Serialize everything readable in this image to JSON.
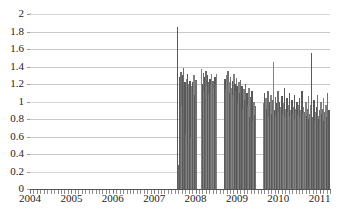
{
  "chart_data": {
    "type": "bar",
    "title": "",
    "subtitle": "",
    "xlabel": "",
    "ylabel": "",
    "xlim": [
      2004.0,
      2011.25
    ],
    "ylim": [
      0,
      2
    ],
    "grid": true,
    "legend": false,
    "legend_position": "none",
    "bar_color": "#6a6a6a",
    "gridline_color": "#c8c8c8",
    "axis_color": "#555555",
    "y_ticks": [
      "0",
      "0.2",
      "0.4",
      "0.6",
      "0.8",
      "1",
      "1.2",
      "1.4",
      "1.6",
      "1.8",
      "2"
    ],
    "y_tick_values": [
      0,
      0.2,
      0.4,
      0.6,
      0.8,
      1.0,
      1.2,
      1.4,
      1.6,
      1.8,
      2.0
    ],
    "x_ticks": [
      "2004",
      "2005",
      "2006",
      "2007",
      "2008",
      "2009",
      "2010",
      "2011"
    ],
    "x_tick_values": [
      2004,
      2005,
      2006,
      2007,
      2008,
      2009,
      2010,
      2011
    ],
    "x": [
      2007.55,
      2007.57,
      2007.59,
      2007.61,
      2007.63,
      2007.65,
      2007.67,
      2007.69,
      2007.71,
      2007.73,
      2007.75,
      2007.77,
      2007.79,
      2007.81,
      2007.83,
      2007.85,
      2007.87,
      2007.89,
      2007.91,
      2007.93,
      2007.95,
      2007.97,
      2007.99,
      2008.13,
      2008.15,
      2008.17,
      2008.19,
      2008.21,
      2008.23,
      2008.25,
      2008.27,
      2008.29,
      2008.31,
      2008.33,
      2008.35,
      2008.37,
      2008.39,
      2008.41,
      2008.43,
      2008.45,
      2008.47,
      2008.49,
      2008.69,
      2008.71,
      2008.73,
      2008.75,
      2008.77,
      2008.79,
      2008.81,
      2008.83,
      2008.85,
      2008.87,
      2008.89,
      2008.91,
      2008.93,
      2008.95,
      2008.97,
      2008.99,
      2009.01,
      2009.03,
      2009.05,
      2009.07,
      2009.09,
      2009.11,
      2009.13,
      2009.15,
      2009.17,
      2009.19,
      2009.21,
      2009.23,
      2009.25,
      2009.27,
      2009.29,
      2009.31,
      2009.33,
      2009.35,
      2009.37,
      2009.39,
      2009.41,
      2009.43,
      2009.63,
      2009.65,
      2009.67,
      2009.69,
      2009.71,
      2009.73,
      2009.75,
      2009.77,
      2009.79,
      2009.81,
      2009.83,
      2009.85,
      2009.87,
      2009.89,
      2009.91,
      2009.93,
      2009.95,
      2009.97,
      2009.99,
      2010.01,
      2010.03,
      2010.05,
      2010.07,
      2010.09,
      2010.11,
      2010.13,
      2010.15,
      2010.17,
      2010.19,
      2010.21,
      2010.23,
      2010.25,
      2010.27,
      2010.29,
      2010.31,
      2010.33,
      2010.35,
      2010.37,
      2010.39,
      2010.41,
      2010.43,
      2010.45,
      2010.47,
      2010.49,
      2010.51,
      2010.53,
      2010.55,
      2010.57,
      2010.59,
      2010.61,
      2010.63,
      2010.65,
      2010.67,
      2010.69,
      2010.71,
      2010.73,
      2010.75,
      2010.77,
      2010.79,
      2010.81,
      2010.83,
      2010.85,
      2010.87,
      2010.89,
      2010.91,
      2010.93,
      2010.95,
      2010.97,
      2010.99,
      2011.01,
      2011.03,
      2011.05,
      2011.07,
      2011.09,
      2011.11,
      2011.13,
      2011.15,
      2011.17,
      2011.19,
      2011.21
    ],
    "values": [
      1.85,
      0.28,
      0.22,
      1.28,
      1.34,
      0.95,
      1.3,
      1.38,
      1.02,
      1.22,
      0.62,
      1.26,
      1.31,
      0.72,
      1.2,
      1.24,
      0.58,
      1.18,
      1.22,
      0.95,
      1.3,
      1.08,
      1.25,
      1.37,
      1.2,
      1.33,
      1.12,
      1.28,
      1.35,
      1.18,
      1.3,
      1.22,
      1.08,
      1.26,
      1.19,
      1.32,
      1.1,
      1.24,
      1.15,
      1.28,
      1.2,
      1.31,
      1.26,
      1.14,
      1.3,
      1.18,
      1.35,
      1.22,
      1.1,
      1.28,
      1.16,
      1.24,
      1.08,
      1.31,
      1.2,
      1.12,
      1.27,
      1.18,
      0.98,
      1.22,
      1.1,
      1.25,
      1.05,
      1.18,
      0.92,
      1.14,
      1.02,
      1.2,
      0.88,
      1.1,
      0.95,
      1.16,
      0.82,
      1.05,
      0.9,
      1.12,
      0.78,
      1.0,
      0.85,
      0.95,
      0.98,
      1.1,
      0.88,
      1.04,
      0.92,
      1.12,
      0.82,
      1.0,
      0.95,
      1.08,
      0.86,
      1.02,
      1.45,
      0.9,
      1.05,
      0.84,
      0.98,
      1.12,
      0.88,
      1.0,
      0.8,
      0.94,
      1.06,
      0.86,
      0.98,
      1.15,
      0.82,
      0.92,
      1.04,
      0.88,
      0.96,
      1.1,
      0.84,
      0.9,
      1.02,
      0.86,
      0.94,
      1.08,
      0.8,
      0.92,
      1.0,
      0.85,
      0.96,
      1.04,
      0.82,
      0.9,
      1.12,
      0.86,
      0.94,
      0.78,
      0.88,
      1.0,
      0.84,
      0.92,
      1.06,
      0.8,
      0.86,
      0.96,
      1.55,
      0.82,
      0.9,
      1.02,
      0.78,
      0.88,
      0.94,
      1.08,
      0.84,
      0.8,
      0.9,
      1.0,
      0.86,
      0.92,
      1.04,
      0.78,
      0.88,
      0.96,
      0.82,
      1.1,
      0.84,
      0.9
    ]
  }
}
